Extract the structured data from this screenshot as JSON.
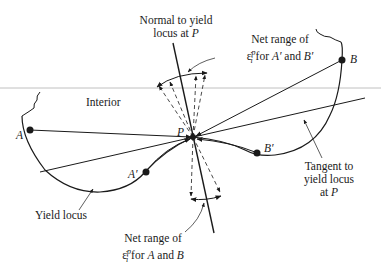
{
  "labels": {
    "normal": [
      "Normal to yield",
      "locus at"
    ],
    "normal_point": "P",
    "net_range_top": [
      "Net range of",
      "for",
      "A′",
      "and",
      "B′"
    ],
    "strain_symbol": "ε̇",
    "strain_sup": "p",
    "strain_sub": "i",
    "interior": "Interior",
    "point_A": "A",
    "point_B": "B",
    "point_Ap": "A′",
    "point_Bp": "B′",
    "point_P": "P",
    "tangent": [
      "Tangent to",
      "yield locus",
      "at"
    ],
    "tangent_point": "P",
    "yield_locus": "Yield locus",
    "net_range_bottom": [
      "Net range of",
      "for",
      "A",
      "and",
      "B"
    ]
  },
  "colors": {
    "line": "#1a1a1a",
    "reference_line": "#b0b0b0",
    "background": "#ffffff"
  }
}
